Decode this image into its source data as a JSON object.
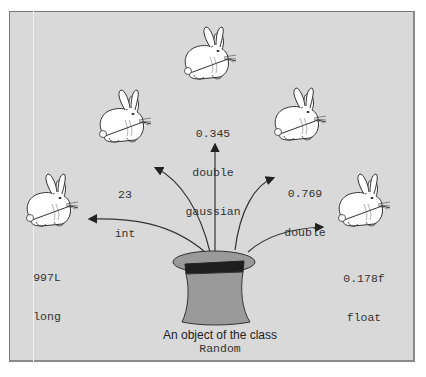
{
  "diagram": {
    "caption": {
      "line1": "An object of the class",
      "class_name": "Random"
    },
    "rabbits": [
      {
        "value": "997L",
        "type": "long"
      },
      {
        "value": "23",
        "type": "int"
      },
      {
        "value": "0.345",
        "type": "double",
        "extra": "gaussian"
      },
      {
        "value": "0.769",
        "type": "double"
      },
      {
        "value": "0.178f",
        "type": "float"
      }
    ],
    "colors": {
      "background": "#d9d9d9",
      "hat_body": "#9a9a9a",
      "hat_band": "#1e1e1e",
      "rabbit_fill": "#ffffff",
      "arrow": "#333333"
    }
  }
}
